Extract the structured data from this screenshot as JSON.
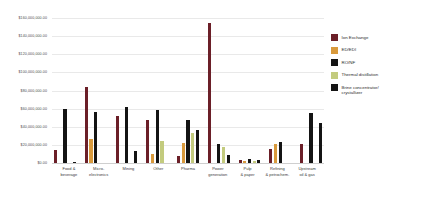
{
  "chart_data": {
    "type": "bar",
    "title": "",
    "xlabel": "",
    "ylabel": "",
    "ylim": [
      0,
      160000000
    ],
    "grid": true,
    "legend_position": "right",
    "categories": [
      "Food &\nbeverage",
      "Micro-\nelectronics",
      "Mining",
      "Other",
      "Pharma",
      "Power\ngeneration",
      "Pulp\n& paper",
      "Refining\n& petrochem.",
      "Upstream\noil & gas"
    ],
    "y_ticks": [
      "$160,000,000.00",
      "$140,000,000.00",
      "$120,000,000.00",
      "$100,000,000.00",
      "$80,000,000.00",
      "$60,000,000.00",
      "$40,000,000.00",
      "$20,000,000.00",
      "$0.00"
    ],
    "series": [
      {
        "name": "Ion Exchange",
        "color": "#6B1F28",
        "values": [
          14000000,
          84000000,
          52000000,
          48000000,
          8000000,
          155000000,
          3000000,
          15000000,
          21000000
        ]
      },
      {
        "name": "ED/EDI",
        "color": "#D99A3C",
        "values": [
          0,
          26000000,
          0,
          10000000,
          22000000,
          0,
          2000000,
          21000000,
          0
        ]
      },
      {
        "name": "RO/NF",
        "color": "#141414",
        "values": [
          60000000,
          56000000,
          62000000,
          58000000,
          47000000,
          21000000,
          4000000,
          23000000,
          55000000
        ]
      },
      {
        "name": "Thermal distillation",
        "color": "#C3CB7E",
        "values": [
          0,
          0,
          0,
          24000000,
          33000000,
          18000000,
          2000000,
          0,
          0
        ]
      },
      {
        "name": "Brine concentrator/\ncrystallizer",
        "color": "#141414",
        "values": [
          1500000,
          0,
          13000000,
          0,
          36000000,
          9000000,
          3000000,
          0,
          44000000
        ]
      }
    ]
  }
}
